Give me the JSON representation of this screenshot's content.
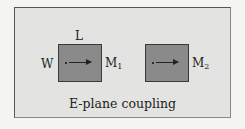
{
  "diagram": {
    "caption": "E-plane coupling",
    "labels": {
      "L": "L",
      "W": "W",
      "M1_main": "M",
      "M1_sub": "1",
      "M2_main": "M",
      "M2_sub": "2"
    },
    "colors": {
      "background": "#e3e3e1",
      "resonator_fill": "#8a8a8a",
      "border": "#3a3a3a"
    }
  }
}
